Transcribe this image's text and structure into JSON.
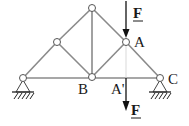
{
  "diagram": {
    "type": "truss",
    "colors": {
      "member": "#8a8a8a",
      "joint_fill": "#ffffff",
      "joint_stroke": "#555555",
      "arrow": "#111111",
      "text": "#1a1a1a"
    },
    "joints": [
      {
        "id": "L",
        "x": 23,
        "y": 78,
        "label": ""
      },
      {
        "id": "UL",
        "x": 57,
        "y": 42,
        "label": ""
      },
      {
        "id": "T",
        "x": 92,
        "y": 8,
        "label": ""
      },
      {
        "id": "A",
        "x": 126,
        "y": 42,
        "label": "A"
      },
      {
        "id": "B",
        "x": 92,
        "y": 77,
        "label": "B"
      },
      {
        "id": "C",
        "x": 160,
        "y": 78,
        "label": "C"
      }
    ],
    "labels": {
      "A": "A",
      "A_prime": "A'",
      "B": "B",
      "C": "C",
      "force_top": "F",
      "force_bottom": "F"
    },
    "forces": [
      {
        "name": "F",
        "at": "A",
        "direction": "down",
        "position": "above A"
      },
      {
        "name": "F",
        "at": "A'",
        "direction": "down",
        "position": "below A'"
      }
    ],
    "supports": [
      {
        "at": "L",
        "type": "pin"
      },
      {
        "at": "C",
        "type": "pin"
      }
    ]
  }
}
